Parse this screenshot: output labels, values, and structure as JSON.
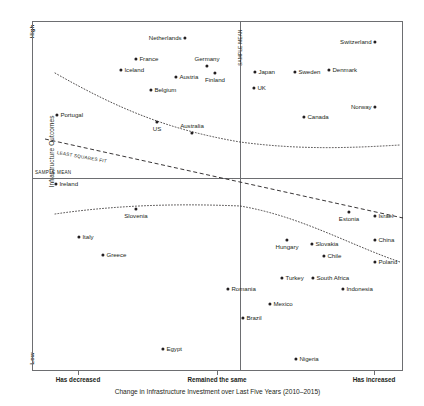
{
  "chart_data": {
    "type": "scatter",
    "title": "",
    "xlabel": "Change in Infrastructure Investment over Last Five Years (2010–2015)",
    "ylabel": "Infrastructure Outcomes",
    "xticks": [
      "Has decreased",
      "Remained the same",
      "Has increased"
    ],
    "yticks": [
      "High",
      "Low"
    ],
    "grid": false,
    "legend": "none",
    "reference_lines": [
      {
        "name": "sample-mean-horizontal",
        "label": "SAMPLE MEAN",
        "orientation": "horizontal"
      },
      {
        "name": "sample-mean-vertical",
        "label": "SAMPLE MEAN",
        "orientation": "vertical"
      }
    ],
    "fits": [
      {
        "name": "least-squares-fit",
        "label": "LEAST SQUARES FIT",
        "style": "dashed"
      },
      {
        "name": "smoothed-fit",
        "label": "",
        "style": "dotted"
      }
    ],
    "points": [
      {
        "label": "Netherlands",
        "px": 185,
        "py": 38,
        "pos": "l"
      },
      {
        "label": "Switzerland",
        "px": 375,
        "py": 42,
        "pos": "l"
      },
      {
        "label": "France",
        "px": 136,
        "py": 59,
        "pos": "r"
      },
      {
        "label": "Germany",
        "px": 207,
        "py": 66,
        "pos": "t"
      },
      {
        "label": "Iceland",
        "px": 121,
        "py": 70,
        "pos": "r"
      },
      {
        "label": "Austria",
        "px": 176,
        "py": 77,
        "pos": "r"
      },
      {
        "label": "Finland",
        "px": 215,
        "py": 73,
        "pos": "b"
      },
      {
        "label": "Japan",
        "px": 255,
        "py": 72,
        "pos": "r"
      },
      {
        "label": "Sweden",
        "px": 295,
        "py": 72,
        "pos": "r"
      },
      {
        "label": "Denmark",
        "px": 329,
        "py": 70,
        "pos": "r"
      },
      {
        "label": "UK",
        "px": 254,
        "py": 88,
        "pos": "r"
      },
      {
        "label": "Belgium",
        "px": 151,
        "py": 90,
        "pos": "r"
      },
      {
        "label": "Portugal",
        "px": 57,
        "py": 115,
        "pos": "r"
      },
      {
        "label": "Norway",
        "px": 375,
        "py": 107,
        "pos": "l"
      },
      {
        "label": "Canada",
        "px": 304,
        "py": 117,
        "pos": "r"
      },
      {
        "label": "US",
        "px": 157,
        "py": 122,
        "pos": "b"
      },
      {
        "label": "Australia",
        "px": 192,
        "py": 133,
        "pos": "t"
      },
      {
        "label": "Ireland",
        "px": 56,
        "py": 184,
        "pos": "r"
      },
      {
        "label": "Slovenia",
        "px": 136,
        "py": 209,
        "pos": "b"
      },
      {
        "label": "Estonia",
        "px": 349,
        "py": 212,
        "pos": "b"
      },
      {
        "label": "Israel",
        "px": 375,
        "py": 216,
        "pos": "r"
      },
      {
        "label": "Italy",
        "px": 79,
        "py": 237,
        "pos": "r"
      },
      {
        "label": "Hungary",
        "px": 287,
        "py": 240,
        "pos": "b"
      },
      {
        "label": "Slovakia",
        "px": 312,
        "py": 244,
        "pos": "r"
      },
      {
        "label": "China",
        "px": 375,
        "py": 240,
        "pos": "r"
      },
      {
        "label": "Greece",
        "px": 103,
        "py": 255,
        "pos": "r"
      },
      {
        "label": "Chile",
        "px": 324,
        "py": 256,
        "pos": "r"
      },
      {
        "label": "Poland",
        "px": 375,
        "py": 262,
        "pos": "r"
      },
      {
        "label": "Turkey",
        "px": 282,
        "py": 278,
        "pos": "r"
      },
      {
        "label": "South Africa",
        "px": 313,
        "py": 278,
        "pos": "r"
      },
      {
        "label": "Romania",
        "px": 228,
        "py": 289,
        "pos": "r"
      },
      {
        "label": "Indonesia",
        "px": 343,
        "py": 289,
        "pos": "r"
      },
      {
        "label": "Mexico",
        "px": 270,
        "py": 304,
        "pos": "r"
      },
      {
        "label": "Brazil",
        "px": 243,
        "py": 318,
        "pos": "r"
      },
      {
        "label": "Egypt",
        "px": 163,
        "py": 349,
        "pos": "r"
      },
      {
        "label": "Nigeria",
        "px": 296,
        "py": 359,
        "pos": "r"
      }
    ]
  },
  "axes": {
    "y_title": "Infrastructure Outcomes",
    "y_high": "High",
    "y_low": "Low",
    "x_title": "Change in Infrastructure Investment over Last Five Years (2010–2015)",
    "x_ticks": [
      {
        "label": "Has decreased",
        "px": 78
      },
      {
        "label": "Remained the same",
        "px": 217
      },
      {
        "label": "Has increased",
        "px": 374
      }
    ]
  },
  "annotations": {
    "sample_mean_horizontal": "SAMPLE MEAN",
    "sample_mean_vertical": "SAMPLE MEAN",
    "least_squares_fit": "LEAST SQUARES FIT"
  },
  "colors": {
    "point": "#231f20",
    "frame": "#6d6e71",
    "text": "#231f20"
  }
}
